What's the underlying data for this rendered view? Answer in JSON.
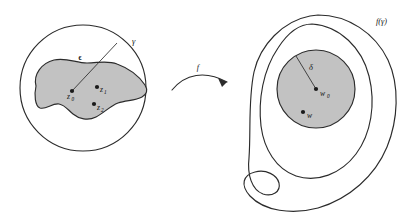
{
  "figure": {
    "colors": {
      "stroke": "#2b2b2b",
      "region_fill": "#c2c2c2",
      "point": "#1a1a1a",
      "background": "#ffffff"
    },
    "domain_side": {
      "boundary_label": "γ",
      "radius_label": "ϵ",
      "points": [
        {
          "id": "z0",
          "label": "z",
          "subscript": "0",
          "x": 72,
          "y": 91
        },
        {
          "id": "z1",
          "label": "z",
          "subscript": "1",
          "x": 97,
          "y": 87
        },
        {
          "id": "z2",
          "label": "z",
          "subscript": "2",
          "x": 94,
          "y": 104
        }
      ]
    },
    "map_arrow": {
      "label": "f"
    },
    "range_side": {
      "boundary_label": "f(γ)",
      "radius_label": "δ",
      "points": [
        {
          "id": "w0",
          "label": "w",
          "subscript": "0",
          "x": 316,
          "y": 91
        },
        {
          "id": "w",
          "label": "w",
          "subscript": "",
          "x": 303,
          "y": 112
        }
      ]
    }
  }
}
